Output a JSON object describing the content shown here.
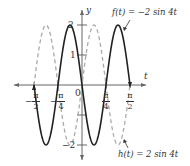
{
  "chart_data": {
    "type": "line",
    "title": "",
    "xlabel": "t",
    "ylabel": "y",
    "xlim": [
      -1.75,
      2.0
    ],
    "ylim": [
      -2.5,
      2.5
    ],
    "x_tick_labels": [
      "-π/2",
      "-π/4",
      "π/4",
      "π/2"
    ],
    "y_tick_labels": [
      "2",
      "1",
      "-2"
    ],
    "origin_label": "0",
    "grid": false,
    "series": [
      {
        "name": "f(t) = −2 sin 4t",
        "style": "solid",
        "color": "#222222",
        "amplitude": -2,
        "frequency": 4,
        "domain": [
          -1.5708,
          1.5708
        ]
      },
      {
        "name": "h(t) = 2 sin 4t",
        "style": "dashed",
        "color": "#aaaaaa",
        "amplitude": 2,
        "frequency": 4,
        "domain": [
          -1.5708,
          1.5708
        ]
      }
    ],
    "annotations": [
      {
        "text": "f(t) = −2 sin 4t",
        "position": "top-right"
      },
      {
        "text": "h(t) = 2 sin 4t",
        "position": "bottom-right"
      }
    ]
  },
  "labels": {
    "y_axis": "y",
    "t_axis": "t",
    "y_two": "2",
    "y_one": "1",
    "y_neg_two": "−2",
    "origin": "0",
    "neg_half_pi_sign": "−",
    "neg_quarter_pi_sign": "−",
    "pi": "π",
    "two": "2",
    "four": "4",
    "f_label": "f(t) = −2 sin 4t",
    "h_label": "h(t) = 2 sin 4t"
  }
}
